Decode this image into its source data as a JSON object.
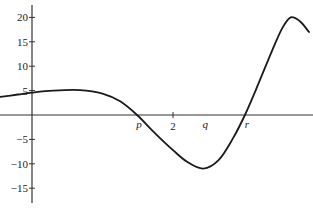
{
  "chart_data": {
    "type": "line",
    "title": "",
    "xlabel": "",
    "ylabel": "",
    "grid": false,
    "xlim": [
      -0.45,
      3.98
    ],
    "ylim": [
      -18,
      22
    ],
    "y_ticks": [
      20,
      15,
      10,
      5,
      -5,
      -10,
      -15
    ],
    "y_tick_labels": [
      "20",
      "15",
      "10",
      "5",
      "−5",
      "−10",
      "−15"
    ],
    "x_ticks": [
      2
    ],
    "x_tick_labels": [
      "2"
    ],
    "x_annotations": [
      {
        "label": "p",
        "x": 1.49
      },
      {
        "label": "q",
        "x": 2.43
      },
      {
        "label": "r",
        "x": 3.02
      }
    ],
    "series": [
      {
        "name": "f(x)",
        "x": [
          -0.45,
          -0.2,
          0.0,
          0.3,
          0.68,
          1.0,
          1.25,
          1.49,
          1.75,
          2.0,
          2.2,
          2.43,
          2.65,
          2.85,
          3.02,
          3.2,
          3.4,
          3.55,
          3.67,
          3.8,
          3.93
        ],
        "y": [
          3.7,
          4.2,
          4.6,
          5.0,
          5.1,
          4.4,
          2.8,
          0.0,
          -3.8,
          -7.2,
          -9.6,
          -11.0,
          -9.2,
          -4.8,
          0.0,
          6.0,
          13.0,
          17.8,
          20.0,
          19.2,
          17.0
        ]
      }
    ]
  }
}
